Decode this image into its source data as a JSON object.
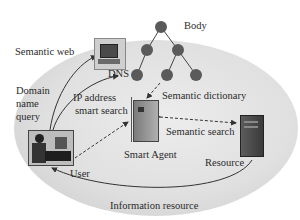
{
  "diagram": {
    "labels": {
      "body": "Body",
      "semantic_web": "Semantic web",
      "dns": "DNS",
      "domain_name_query_1": "Domain",
      "domain_name_query_2": "name",
      "domain_name_query_3": "query",
      "ip_address_1": "IP address",
      "ip_address_2": "smart search",
      "semantic_dictionary": "Semantic dictionary",
      "semantic_search": "Semantic search",
      "smart_agent": "Smart Agent",
      "user": "User",
      "resource": "Resource",
      "information_resource": "Information resource"
    },
    "nodes": [
      {
        "id": "semantic-web-computer",
        "type": "computer",
        "label_key": "semantic_web"
      },
      {
        "id": "user",
        "type": "person-at-computer",
        "label_key": "user"
      },
      {
        "id": "smart-agent",
        "type": "server",
        "label_key": "smart_agent"
      },
      {
        "id": "resource",
        "type": "server-tower",
        "label_key": "resource"
      },
      {
        "id": "dns-tree",
        "type": "tree",
        "label_key": "body",
        "tree_nodes": 6
      }
    ],
    "edges": [
      {
        "from": "user",
        "to": "semantic-web-computer",
        "style": "solid",
        "label_key": "domain_name_query_1"
      },
      {
        "from": "user",
        "to": "dns",
        "style": "solid"
      },
      {
        "from": "user",
        "to": "smart-agent",
        "style": "dashed",
        "label_key": "ip_address_1"
      },
      {
        "from": "tree",
        "to": "smart-agent",
        "style": "dashed",
        "label_key": "semantic_dictionary"
      },
      {
        "from": "resource",
        "to": "smart-agent",
        "style": "dashed",
        "label_key": "semantic_search"
      },
      {
        "from": "resource",
        "to": "user",
        "style": "solid",
        "label_key": "information_resource"
      }
    ],
    "colors": {
      "ellipse": "#e0e0e0",
      "tree_node": "#5a5a5a",
      "line": "#333333"
    }
  }
}
